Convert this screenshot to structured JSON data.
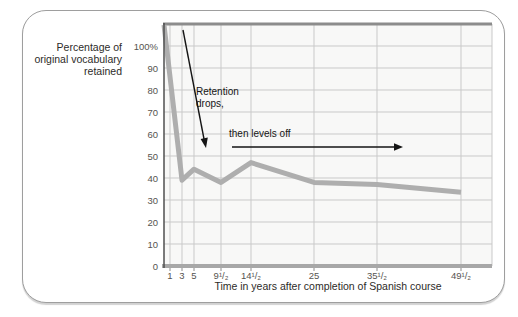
{
  "card": {
    "background": "#ffffff",
    "border_color": "#9e9e9e"
  },
  "y_axis_title": {
    "line1": "Percentage of",
    "line2": "original vocabulary",
    "line3": "retained"
  },
  "x_axis_title": "Time in years after completion of Spanish course",
  "annotations": {
    "retention_drops_line1": "Retention",
    "retention_drops_line2": "drops,",
    "then_levels_off": "then levels off"
  },
  "chart_data": {
    "type": "line",
    "title": "",
    "xlabel": "Time in years after completion of Spanish course",
    "ylabel": "Percentage of original vocabulary retained",
    "xlim": [
      0,
      54.5
    ],
    "ylim": [
      0,
      110
    ],
    "grid": true,
    "legend": "none",
    "x_ticks": [
      {
        "v": 1,
        "label": "1"
      },
      {
        "v": 3,
        "label": "3"
      },
      {
        "v": 5,
        "label": "5"
      },
      {
        "v": 9.5,
        "label": "9¹/₂"
      },
      {
        "v": 14.5,
        "label": "14¹/₂"
      },
      {
        "v": 25,
        "label": "25"
      },
      {
        "v": 35.5,
        "label": "35¹/₂"
      },
      {
        "v": 49.5,
        "label": "49¹/₂"
      }
    ],
    "y_ticks": [
      {
        "v": 100,
        "label": "100%"
      },
      {
        "v": 90,
        "label": "90"
      },
      {
        "v": 80,
        "label": "80"
      },
      {
        "v": 70,
        "label": "70"
      },
      {
        "v": 60,
        "label": "60"
      },
      {
        "v": 50,
        "label": "50"
      },
      {
        "v": 40,
        "label": "40"
      },
      {
        "v": 30,
        "label": "30"
      },
      {
        "v": 20,
        "label": "20"
      },
      {
        "v": 10,
        "label": "10"
      },
      {
        "v": 0,
        "label": "0"
      }
    ],
    "points": [
      {
        "t": 0,
        "v": 100
      },
      {
        "t": 3,
        "v": 39
      },
      {
        "t": 5,
        "v": 44
      },
      {
        "t": 9.5,
        "v": 38
      },
      {
        "t": 14.5,
        "v": 47
      },
      {
        "t": 25,
        "v": 38
      },
      {
        "t": 35.5,
        "v": 37
      },
      {
        "t": 49.5,
        "v": 33.5
      }
    ],
    "visual_note": "curve is drawn starting at the plot's top-left corner, above the 100% gridline",
    "start_at_plot_corner": true,
    "annotations": [
      "Retention drops, (down arrow)",
      "then levels off (right arrow)"
    ],
    "line_color": "#aeaeae"
  },
  "colors": {
    "plot_background": "#f8f8f7",
    "gridline": "#c9c9c9",
    "left_axis": "#4f4f4f",
    "top_border": "#8c8c8c",
    "bottom_axis": "#a8a8a8",
    "data_line": "#aeaeae",
    "annotation_arrow": "#151515",
    "tick_text": "#56544f",
    "title_text": "#2d2b28"
  }
}
